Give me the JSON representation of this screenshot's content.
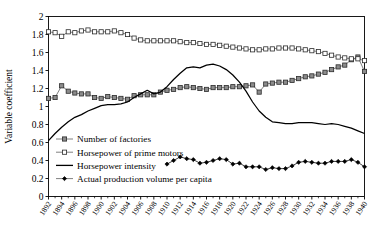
{
  "chart_data": {
    "type": "line",
    "title": "",
    "xlabel": "",
    "ylabel": "Variable coefficient",
    "ylim": [
      0,
      2
    ],
    "xlim": [
      1892,
      1940
    ],
    "ytick_labels": [
      "0",
      "0.2",
      "0.4",
      "0.6",
      "0.8",
      "1",
      "1.2",
      "1.4",
      "1.6",
      "1.8",
      "2"
    ],
    "ytick_values": [
      0,
      0.2,
      0.4,
      0.6,
      0.8,
      1,
      1.2,
      1.4,
      1.6,
      1.8,
      2
    ],
    "xtick_labels": [
      "1892",
      "1894",
      "1896",
      "1898",
      "1900",
      "1902",
      "1904",
      "1906",
      "1908",
      "1910",
      "1912",
      "1914",
      "1916",
      "1918",
      "1920",
      "1922",
      "1924",
      "1926",
      "1928",
      "1930",
      "1932",
      "1934",
      "1936",
      "1938",
      "1940"
    ],
    "xtick_values": [
      1892,
      1894,
      1896,
      1898,
      1900,
      1902,
      1904,
      1906,
      1908,
      1910,
      1912,
      1914,
      1916,
      1918,
      1920,
      1922,
      1924,
      1926,
      1928,
      1930,
      1932,
      1934,
      1936,
      1938,
      1940
    ],
    "grid": false,
    "legend_position": "inside-lower-left",
    "series": [
      {
        "name": "Number of factories",
        "marker": "filled-square",
        "color": "#808080",
        "line_color": "#555555",
        "x": [
          1892,
          1893,
          1894,
          1895,
          1896,
          1897,
          1898,
          1899,
          1900,
          1901,
          1902,
          1903,
          1904,
          1905,
          1906,
          1907,
          1908,
          1909,
          1910,
          1911,
          1912,
          1913,
          1914,
          1915,
          1916,
          1917,
          1918,
          1919,
          1920,
          1921,
          1922,
          1923,
          1924,
          1925,
          1926,
          1927,
          1928,
          1929,
          1930,
          1931,
          1932,
          1933,
          1934,
          1935,
          1936,
          1937,
          1938,
          1939,
          1940
        ],
        "values": [
          1.09,
          1.1,
          1.23,
          1.17,
          1.15,
          1.14,
          1.14,
          1.1,
          1.09,
          1.11,
          1.1,
          1.09,
          1.08,
          1.12,
          1.13,
          1.13,
          1.13,
          1.16,
          1.18,
          1.19,
          1.21,
          1.22,
          1.21,
          1.2,
          1.19,
          1.21,
          1.21,
          1.21,
          1.22,
          1.22,
          1.23,
          1.24,
          1.16,
          1.25,
          1.26,
          1.27,
          1.27,
          1.29,
          1.31,
          1.33,
          1.34,
          1.36,
          1.38,
          1.41,
          1.44,
          1.46,
          1.52,
          1.55,
          1.39
        ]
      },
      {
        "name": "Horsepower of prime motors",
        "marker": "open-square",
        "color": "#ffffff",
        "line_color": "#555555",
        "x": [
          1892,
          1893,
          1894,
          1895,
          1896,
          1897,
          1898,
          1899,
          1900,
          1901,
          1902,
          1903,
          1904,
          1905,
          1906,
          1907,
          1908,
          1909,
          1910,
          1911,
          1912,
          1913,
          1914,
          1915,
          1916,
          1917,
          1918,
          1919,
          1920,
          1921,
          1922,
          1923,
          1924,
          1925,
          1926,
          1927,
          1928,
          1929,
          1930,
          1931,
          1932,
          1933,
          1934,
          1935,
          1936,
          1937,
          1938,
          1939,
          1940
        ],
        "values": [
          1.83,
          1.82,
          1.78,
          1.83,
          1.82,
          1.84,
          1.85,
          1.83,
          1.83,
          1.83,
          1.84,
          1.82,
          1.8,
          1.76,
          1.74,
          1.73,
          1.73,
          1.73,
          1.73,
          1.73,
          1.72,
          1.71,
          1.71,
          1.7,
          1.69,
          1.69,
          1.68,
          1.67,
          1.66,
          1.65,
          1.64,
          1.63,
          1.63,
          1.64,
          1.64,
          1.65,
          1.65,
          1.65,
          1.64,
          1.63,
          1.62,
          1.61,
          1.59,
          1.57,
          1.55,
          1.54,
          1.53,
          1.53,
          1.51
        ]
      },
      {
        "name": "Horsepower intensity",
        "marker": "none",
        "color": "#000000",
        "line_color": "#000000",
        "x": [
          1892,
          1893,
          1894,
          1895,
          1896,
          1897,
          1898,
          1899,
          1900,
          1901,
          1902,
          1903,
          1904,
          1905,
          1906,
          1907,
          1908,
          1909,
          1910,
          1911,
          1912,
          1913,
          1914,
          1915,
          1916,
          1917,
          1918,
          1919,
          1920,
          1921,
          1922,
          1923,
          1924,
          1925,
          1926,
          1927,
          1928,
          1929,
          1930,
          1931,
          1932,
          1933,
          1934,
          1935,
          1936,
          1937,
          1938,
          1939,
          1940
        ],
        "values": [
          0.62,
          0.7,
          0.77,
          0.83,
          0.88,
          0.91,
          0.95,
          0.98,
          1.01,
          1.02,
          1.02,
          1.03,
          1.05,
          1.1,
          1.14,
          1.18,
          1.14,
          1.16,
          1.22,
          1.3,
          1.37,
          1.43,
          1.44,
          1.43,
          1.46,
          1.47,
          1.45,
          1.41,
          1.35,
          1.27,
          1.17,
          1.05,
          0.95,
          0.88,
          0.83,
          0.82,
          0.81,
          0.81,
          0.82,
          0.82,
          0.82,
          0.81,
          0.8,
          0.81,
          0.8,
          0.78,
          0.76,
          0.73,
          0.7
        ]
      },
      {
        "name": "Actual production volume per capita",
        "marker": "filled-diamond",
        "color": "#000000",
        "line_color": "#000000",
        "x": [
          1910,
          1911,
          1912,
          1913,
          1914,
          1915,
          1916,
          1917,
          1918,
          1919,
          1920,
          1921,
          1922,
          1923,
          1924,
          1925,
          1926,
          1927,
          1928,
          1929,
          1930,
          1931,
          1932,
          1933,
          1934,
          1935,
          1936,
          1937,
          1938,
          1939,
          1940
        ],
        "values": [
          0.36,
          0.4,
          0.44,
          0.42,
          0.41,
          0.37,
          0.38,
          0.4,
          0.42,
          0.41,
          0.36,
          0.37,
          0.33,
          0.33,
          0.33,
          0.3,
          0.32,
          0.31,
          0.31,
          0.34,
          0.38,
          0.39,
          0.38,
          0.37,
          0.37,
          0.39,
          0.39,
          0.39,
          0.41,
          0.38,
          0.33
        ]
      }
    ]
  },
  "legend": {
    "items": [
      {
        "label": "Number of factories",
        "marker": "filled-square"
      },
      {
        "label": "Horsepower of prime motors",
        "marker": "open-square"
      },
      {
        "label": "Horsepower intensity",
        "marker": "line"
      },
      {
        "label": "Actual production volume per capita",
        "marker": "filled-diamond"
      }
    ]
  },
  "axes": {
    "y_title": "Variable coefficient"
  }
}
